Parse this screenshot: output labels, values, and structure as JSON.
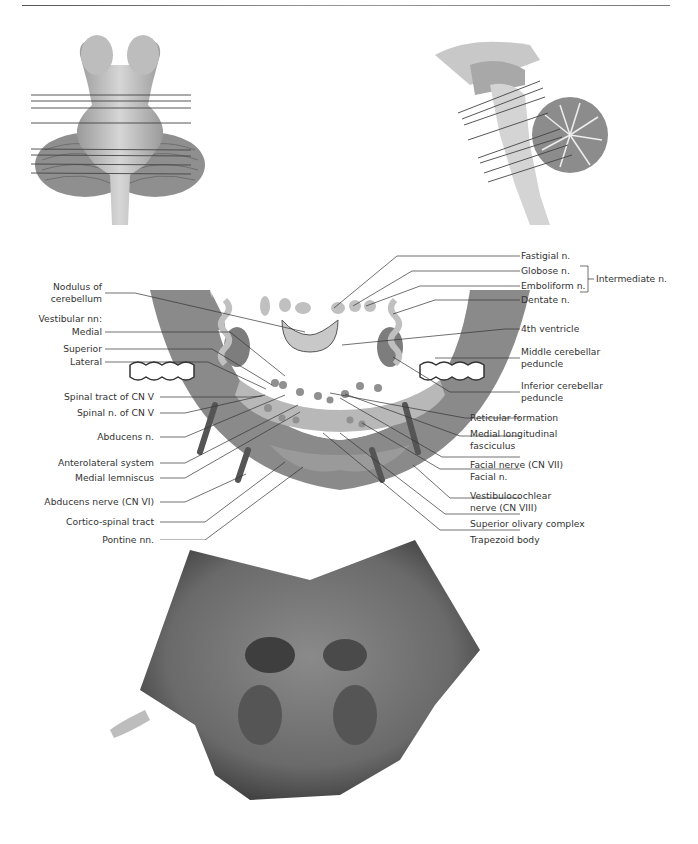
{
  "page": {
    "header_rule": true
  },
  "figures": {
    "thumbnail_ventral": {
      "description": "Ventral view of brainstem with cerebellum showing section levels",
      "section_lines": 8
    },
    "thumbnail_sagittal": {
      "description": "Midsagittal view of brainstem and cerebellum showing section levels",
      "section_lines": 8
    },
    "diagram": {
      "left_labels": [
        {
          "text": "Nodulus of",
          "text2": "cerebellum"
        },
        {
          "text": "Vestibular nn:"
        },
        {
          "text": "Medial"
        },
        {
          "text": "Superior"
        },
        {
          "text": "Lateral"
        },
        {
          "text": "Spinal tract of CN V"
        },
        {
          "text": "Spinal n. of CN V"
        },
        {
          "text": "Abducens n."
        },
        {
          "text": "Anterolateral system"
        },
        {
          "text": "Medial lemniscus"
        },
        {
          "text": "Abducens nerve (CN VI)"
        },
        {
          "text": "Cortico-spinal tract"
        },
        {
          "text": "Pontine nn."
        }
      ],
      "right_labels": [
        {
          "text": "Fastigial n."
        },
        {
          "text": "Globose n."
        },
        {
          "text": "Emboliform n."
        },
        {
          "text": "Intermediate n."
        },
        {
          "text": "Dentate n."
        },
        {
          "text": "4th ventricle"
        },
        {
          "text": "Middle cerebellar",
          "text2": "peduncle"
        },
        {
          "text": "Inferior cerebellar",
          "text2": "peduncle"
        },
        {
          "text": "Reticular formation"
        },
        {
          "text": "Medial longitudinal",
          "text2": "fasciculus"
        },
        {
          "text": "Facial nerve (CN VII)"
        },
        {
          "text": "Facial n."
        },
        {
          "text": "Vestibulocochlear",
          "text2": "nerve (CN VIII)"
        },
        {
          "text": "Superior olivary complex"
        },
        {
          "text": "Trapezoid body"
        }
      ]
    },
    "photo": {
      "description": "Stained transverse section of caudal pons"
    }
  },
  "colors": {
    "peduncle_gray": "#8a8a8a",
    "tegmentum_gray": "#b8b8b8",
    "nucleus_gray": "#a0a0a0",
    "leader_line": "#333333"
  }
}
